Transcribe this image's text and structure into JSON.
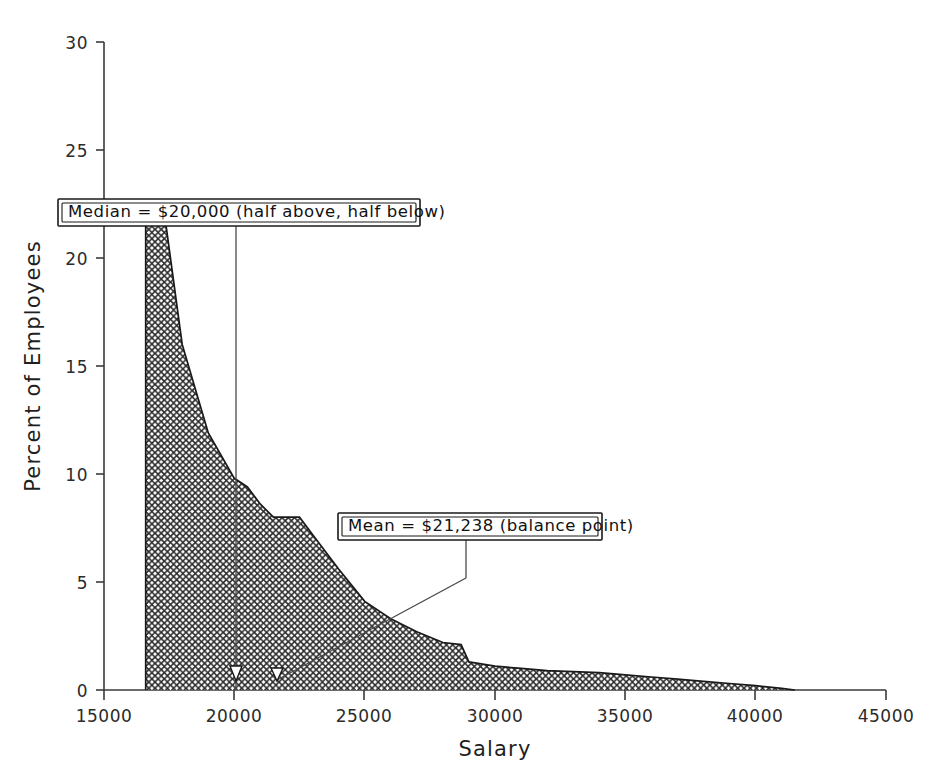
{
  "chart_data": {
    "type": "area",
    "title": "",
    "subtitle": "",
    "xlabel": "Salary",
    "ylabel": "Percent of Employees",
    "xlim": [
      15000,
      45000
    ],
    "ylim": [
      0,
      30
    ],
    "xticks": [
      15000,
      20000,
      25000,
      30000,
      35000,
      40000,
      45000
    ],
    "xtick_labels": [
      "15000",
      "20000",
      "25000",
      "30000",
      "35000",
      "40000",
      "45000"
    ],
    "yticks": [
      0,
      5,
      10,
      15,
      20,
      25,
      30
    ],
    "ytick_labels": [
      "0",
      "5",
      "10",
      "15",
      "20",
      "25",
      "30"
    ],
    "grid": false,
    "legend": null,
    "fill_pattern": "crosshatch",
    "series": [
      {
        "name": "Percent of Employees",
        "x": [
          16600,
          17300,
          18000,
          19000,
          20000,
          20500,
          21000,
          21500,
          22000,
          22500,
          23000,
          24000,
          25000,
          26000,
          27000,
          28000,
          28700,
          29000,
          30000,
          31000,
          32000,
          33000,
          34000,
          35000,
          36000,
          37000,
          38000,
          39000,
          40000,
          41000,
          41500
        ],
        "y": [
          0.0,
          22.2,
          16.0,
          11.9,
          9.8,
          9.4,
          8.6,
          8.0,
          8.0,
          8.0,
          7.2,
          5.6,
          4.1,
          3.3,
          2.7,
          2.2,
          2.1,
          1.3,
          1.1,
          1.0,
          0.9,
          0.85,
          0.8,
          0.7,
          0.6,
          0.5,
          0.4,
          0.3,
          0.2,
          0.08,
          0.0
        ]
      }
    ],
    "annotations": [
      {
        "id": "median",
        "label": "Median = $20,000 (half above, half below)",
        "value": 20000,
        "kind": "vertical-reference-line",
        "marker": "triangle-at-baseline"
      },
      {
        "id": "mean",
        "label": "Mean = $21,238 (balance point)",
        "value": 21238,
        "kind": "leader-line-callout",
        "marker": "triangle-at-baseline"
      }
    ]
  },
  "colors": {
    "background": "#ffffff",
    "ink": "#1a1a1a",
    "axis": "#3a3a3a",
    "annotation_line": "#4a4a4a"
  }
}
